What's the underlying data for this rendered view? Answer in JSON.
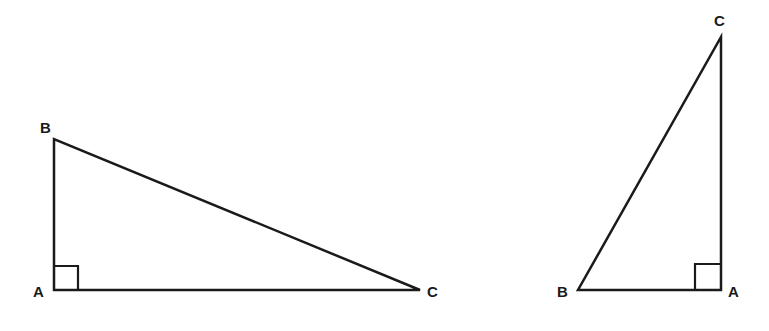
{
  "diagram": {
    "stroke_color": "#1a1a1a",
    "background": "#ffffff",
    "triangles": [
      {
        "id": "left-triangle",
        "orientation": "horizontal",
        "right_angle_at": "A",
        "vertices": {
          "A": {
            "label": "A",
            "x": 54,
            "y": 290
          },
          "B": {
            "label": "B",
            "x": 54,
            "y": 139
          },
          "C": {
            "label": "C",
            "x": 420,
            "y": 290
          }
        },
        "right_angle_box_size": 24
      },
      {
        "id": "right-triangle",
        "orientation": "vertical",
        "right_angle_at": "A",
        "vertices": {
          "A": {
            "label": "A",
            "x": 721,
            "y": 290
          },
          "B": {
            "label": "B",
            "x": 578,
            "y": 290
          },
          "C": {
            "label": "C",
            "x": 721,
            "y": 37
          }
        },
        "right_angle_box_size": 26
      }
    ]
  }
}
